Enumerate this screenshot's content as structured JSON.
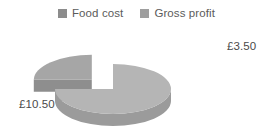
{
  "chart_data": {
    "type": "pie",
    "title": "",
    "subtitle": "",
    "xlabel": "",
    "ylabel": "",
    "categories": [
      "Food cost",
      "Gross profit"
    ],
    "values": [
      10.5,
      3.5
    ],
    "value_labels": [
      "£10.50",
      "£3.50"
    ],
    "percentages": [
      75,
      25
    ],
    "total": 14.0,
    "currency": "£",
    "exploded": [
      false,
      true
    ],
    "three_d": true,
    "legend_position": "top",
    "grid": false,
    "colors": [
      "#b5b5b5",
      "#a6a6a6"
    ],
    "side_colors": [
      "#9b9b9b",
      "#8e8e8e"
    ]
  },
  "legend": {
    "items": [
      {
        "label": "Food cost",
        "color": "#8c8c8c",
        "swatch_name": "legend-swatch-food-cost"
      },
      {
        "label": "Gross profit",
        "color": "#9e9e9e",
        "swatch_name": "legend-swatch-gross-profit"
      }
    ]
  },
  "labels": {
    "food_cost_value": "£10.50",
    "gross_profit_value": "£3.50"
  },
  "palette": {
    "background": "#ffffff",
    "slice_food_cost_top": "#b5b5b5",
    "slice_food_cost_side": "#9b9b9b",
    "slice_gross_profit_top": "#a6a6a6",
    "slice_gross_profit_side": "#8e8e8e",
    "text": "#4a4a4a",
    "legend_text": "#5b5b5b"
  }
}
